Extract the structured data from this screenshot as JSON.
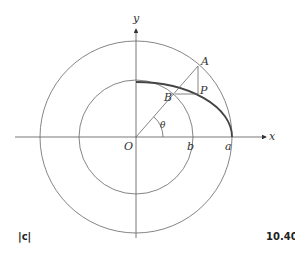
{
  "figure": {
    "tag": "|c|",
    "number": "10.40"
  },
  "labels": {
    "y_axis": "y",
    "x_axis": "x",
    "origin": "O",
    "point_a": "A",
    "point_b": "B",
    "point_p": "P",
    "angle": "θ",
    "inner_radius": "b",
    "outer_radius": "a"
  },
  "colors": {
    "line": "#555555",
    "ellipse": "#444444"
  }
}
